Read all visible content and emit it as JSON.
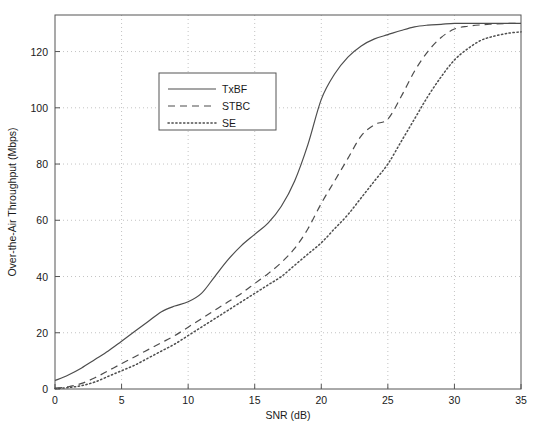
{
  "chart_data": {
    "type": "line",
    "title": "",
    "xlabel": "SNR (dB)",
    "ylabel": "Over-the-Air Throughput (Mbps)",
    "xlim": [
      0,
      35
    ],
    "ylim": [
      0,
      133
    ],
    "xticks": [
      "0",
      "5",
      "10",
      "15",
      "20",
      "25",
      "30",
      "35"
    ],
    "xtick_values": [
      0,
      5,
      10,
      15,
      20,
      25,
      30,
      35
    ],
    "yticks": [
      "0",
      "20",
      "40",
      "60",
      "80",
      "100",
      "120"
    ],
    "ytick_values": [
      0,
      20,
      40,
      60,
      80,
      100,
      120
    ],
    "grid": true,
    "grid_style": "dotted",
    "grid_color": "#b4b4b4",
    "axis_color": "#555555",
    "background": "#ffffff",
    "legend_position": "upper-left-inset",
    "x": [
      0,
      1,
      2,
      3,
      4,
      5,
      6,
      7,
      8,
      9,
      10,
      11,
      12,
      13,
      14,
      15,
      16,
      17,
      18,
      19,
      20,
      21,
      22,
      23,
      24,
      25,
      26,
      27,
      28,
      29,
      30,
      31,
      32,
      33,
      34,
      35
    ],
    "series": [
      {
        "name": "TxBF",
        "line_style": "solid",
        "color": "#4d4d4d",
        "values": [
          3,
          5,
          7.5,
          10.5,
          13.5,
          17,
          20.5,
          24,
          27.5,
          29.5,
          31,
          34,
          40,
          46,
          51,
          55,
          59,
          65,
          74,
          87,
          103,
          112,
          118,
          122,
          124.5,
          126,
          127.5,
          128.8,
          129.4,
          129.7,
          130,
          130,
          130,
          130,
          130,
          130
        ]
      },
      {
        "name": "STBC",
        "line_style": "dashed",
        "color": "#4d4d4d",
        "values": [
          0.3,
          0.8,
          2,
          4,
          6.5,
          9,
          11.5,
          14,
          16.5,
          19,
          22,
          25,
          28,
          31,
          34,
          37.5,
          41,
          45,
          50,
          57,
          66,
          74,
          82,
          90,
          94,
          96,
          104,
          113,
          120,
          125,
          128,
          129,
          129.5,
          129.8,
          130,
          130
        ]
      },
      {
        "name": "SE",
        "line_style": "dotted",
        "color": "#4d4d4d",
        "values": [
          0.2,
          0.5,
          1.2,
          2.5,
          4.5,
          6.5,
          8.5,
          11,
          13.5,
          16,
          19,
          22,
          25,
          28,
          31,
          34,
          37,
          40,
          44,
          48,
          52,
          57,
          62,
          68,
          74,
          80,
          88,
          96,
          104,
          111,
          117,
          121,
          124,
          125.5,
          126.5,
          127
        ]
      }
    ],
    "legend": [
      {
        "label": "TxBF",
        "line_style": "solid"
      },
      {
        "label": "STBC",
        "line_style": "dashed"
      },
      {
        "label": "SE",
        "line_style": "dotted"
      }
    ]
  }
}
